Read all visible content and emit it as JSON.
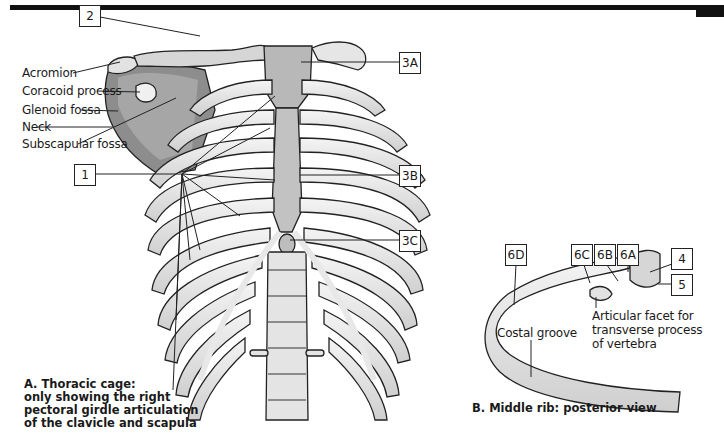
{
  "figure": {
    "panel_a": {
      "caption_lines": [
        "A. Thoracic cage:",
        "only showing the right",
        "pectoral girdle articulation",
        "of the clavicle and scapula"
      ],
      "labels": {
        "acromion": "Acromion",
        "coracoid_process": "Coracoid process",
        "glenoid_fossa": "Glenoid fossa",
        "neck": "Neck",
        "subscapular_fossa": "Subscapular fossa"
      },
      "boxes": {
        "b1": "1",
        "b2": "2",
        "b3a": "3A",
        "b3b": "3B",
        "b3c": "3C"
      }
    },
    "panel_b": {
      "caption": "B. Middle rib: posterior view",
      "labels": {
        "costal_groove": "Costal groove",
        "articular_facet_lines": [
          "Articular facet for",
          "transverse process",
          "of vertebra"
        ]
      },
      "boxes": {
        "b4": "4",
        "b5": "5",
        "b6a": "6A",
        "b6b": "6B",
        "b6c": "6C",
        "b6d": "6D"
      }
    }
  }
}
